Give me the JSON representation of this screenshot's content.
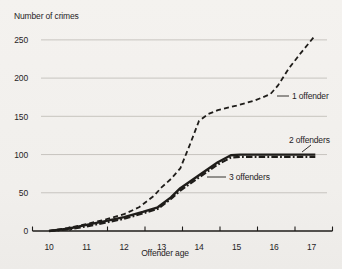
{
  "figure": {
    "background": "#f2f0ed",
    "ink_color": "#1f1d1a",
    "grid_color": "#c7c4bf"
  },
  "chart_data": {
    "type": "line",
    "title": "Number of crimes",
    "xlabel": "Offender age",
    "ylabel": "Number of crimes",
    "x_ticks": [
      10,
      11,
      12,
      13,
      14,
      15,
      16,
      17
    ],
    "y_ticks": [
      0,
      50,
      100,
      150,
      200,
      250
    ],
    "xlim": [
      10,
      17
    ],
    "ylim": [
      0,
      260
    ],
    "grid": "horizontal gridlines at 50,100,150,200,250",
    "legend_position": "inline labels next to lines",
    "series": [
      {
        "name": "1 offender",
        "style": "dashed",
        "points": [
          [
            10,
            0
          ],
          [
            10.5,
            4
          ],
          [
            11,
            9
          ],
          [
            11.5,
            15
          ],
          [
            12,
            22
          ],
          [
            12.4,
            31
          ],
          [
            12.8,
            46
          ],
          [
            13,
            57
          ],
          [
            13.25,
            68
          ],
          [
            13.5,
            82
          ],
          [
            13.75,
            112
          ],
          [
            14,
            144
          ],
          [
            14.25,
            153
          ],
          [
            14.5,
            158
          ],
          [
            15,
            164
          ],
          [
            15.5,
            171
          ],
          [
            15.9,
            179
          ],
          [
            16.1,
            190
          ],
          [
            16.4,
            213
          ],
          [
            16.7,
            232
          ],
          [
            17.05,
            253
          ]
        ]
      },
      {
        "name": "2 offenders",
        "style": "solid",
        "points": [
          [
            10,
            0
          ],
          [
            10.5,
            3
          ],
          [
            11,
            8
          ],
          [
            11.5,
            13
          ],
          [
            12,
            18
          ],
          [
            12.5,
            25
          ],
          [
            12.9,
            31
          ],
          [
            13.25,
            44
          ],
          [
            13.5,
            56
          ],
          [
            14,
            73
          ],
          [
            14.5,
            90
          ],
          [
            14.85,
            99
          ],
          [
            15.1,
            100
          ],
          [
            16,
            100
          ],
          [
            17.1,
            100
          ]
        ]
      },
      {
        "name": "3 offenders",
        "style": "dashdot",
        "points": [
          [
            10,
            0
          ],
          [
            10.5,
            2
          ],
          [
            11,
            6
          ],
          [
            11.5,
            11
          ],
          [
            12,
            16
          ],
          [
            12.5,
            23
          ],
          [
            12.9,
            29
          ],
          [
            13.25,
            42
          ],
          [
            13.5,
            53
          ],
          [
            14,
            70
          ],
          [
            14.5,
            87
          ],
          [
            14.85,
            96
          ],
          [
            15.1,
            97
          ],
          [
            16,
            97
          ],
          [
            17.1,
            97
          ]
        ]
      }
    ],
    "annotations": [
      {
        "label": "1 offender",
        "text_x": 292,
        "text_y": 99,
        "line": [
          277,
          96,
          289,
          96
        ]
      },
      {
        "label": "2 offenders",
        "text_x": 289,
        "text_y": 143,
        "line": [
          302,
          152,
          311,
          145
        ]
      },
      {
        "label": "3 offenders",
        "text_x": 229,
        "text_y": 180,
        "line": [
          207,
          177,
          226,
          177
        ]
      }
    ]
  }
}
